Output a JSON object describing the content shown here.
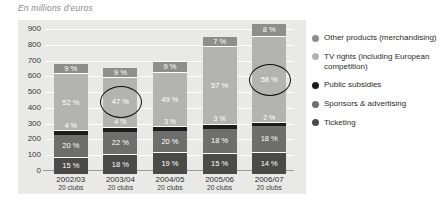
{
  "chart_data": {
    "type": "bar",
    "title": "En millions d'euros",
    "xlabel": "",
    "ylabel": "",
    "ylim": [
      0,
      900
    ],
    "yticks": [
      0,
      100,
      200,
      300,
      400,
      500,
      600,
      700,
      800,
      900
    ],
    "grid": true,
    "stacked": true,
    "value_unit": "%",
    "legend_position": "right",
    "categories": [
      "2002/03",
      "2003/04",
      "2004/05",
      "2005/06",
      "2006/07"
    ],
    "category_sublabels": [
      "20 clubs",
      "20 clubs",
      "20 clubs",
      "20 clubs",
      "20 clubs"
    ],
    "bar_totals": [
      680,
      655,
      690,
      850,
      930
    ],
    "series": [
      {
        "name": "Other products (merchandising)",
        "color": "#8e8e8c",
        "values": [
          9,
          9,
          9,
          7,
          8
        ],
        "labels": [
          "9 %",
          "9 %",
          "9 %",
          "7 %",
          "8 %"
        ]
      },
      {
        "name": "TV rights (including European competition)",
        "color": "#b3b3b1",
        "values": [
          52,
          47,
          49,
          57,
          58
        ],
        "labels": [
          "52 %",
          "47 %",
          "49 %",
          "57 %",
          "58 %"
        ]
      },
      {
        "name": "Public subsidies",
        "color": "#1c1c1c",
        "values": [
          4,
          4,
          3,
          3,
          2
        ],
        "labels": [
          "4 %",
          "4 %",
          "3 %",
          "3 %",
          "2 %"
        ]
      },
      {
        "name": "Sponsors & advertising",
        "color": "#6e6e6c",
        "values": [
          20,
          22,
          20,
          18,
          18
        ],
        "labels": [
          "20 %",
          "22 %",
          "20 %",
          "18 %",
          "18 %"
        ]
      },
      {
        "name": "Ticketing",
        "color": "#4a4a48",
        "values": [
          15,
          18,
          19,
          15,
          14
        ],
        "labels": [
          "15 %",
          "18 %",
          "19 %",
          "15 %",
          "14 %"
        ]
      }
    ],
    "annotations": [
      {
        "name": "highlight-ellipse-2003-04-tv-rights",
        "target_category": "2003/04",
        "target_series": "TV rights (including European competition)",
        "target_label": "47 %"
      },
      {
        "name": "highlight-ellipse-2006-07-tv-rights",
        "target_category": "2006/07",
        "target_series": "TV rights (including European competition)",
        "target_label": "58 %"
      }
    ]
  },
  "legend": {
    "items": [
      {
        "label": "Other products (merchandising)",
        "color": "#8e8e8c"
      },
      {
        "label": "TV rights (including European competition)",
        "color": "#b3b3b1"
      },
      {
        "label": "Public subsidies",
        "color": "#1c1c1c"
      },
      {
        "label": "Sponsors & advertising",
        "color": "#6e6e6c"
      },
      {
        "label": "Ticketing",
        "color": "#4a4a48"
      }
    ]
  },
  "colors": {
    "panel_background": "#e9e9e7",
    "gridline": "#ffffff",
    "axis": "#9a9a98",
    "title_text": "#8a8a8a",
    "annotation_stroke": "#111111"
  }
}
